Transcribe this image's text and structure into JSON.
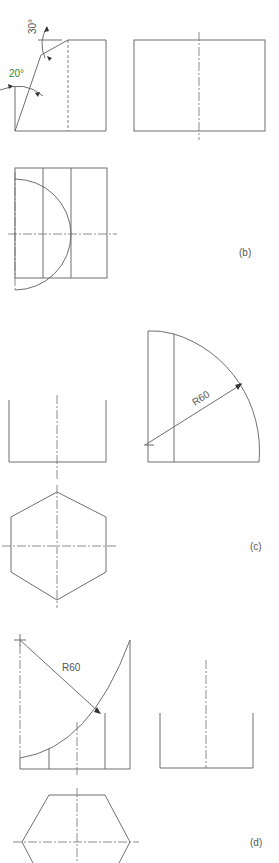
{
  "figure": {
    "panels": [
      {
        "id": "a",
        "annotations": [
          {
            "text": "30°",
            "color": "#555555"
          },
          {
            "text": "20°",
            "color": "#2e8b2e"
          }
        ]
      },
      {
        "id": "b",
        "label": "(b)"
      },
      {
        "id": "c",
        "label": "(c)",
        "annotations": [
          {
            "text": "R60"
          }
        ]
      },
      {
        "id": "d",
        "label": "(d)",
        "annotations": [
          {
            "text": "R60"
          }
        ]
      }
    ]
  },
  "colors": {
    "line": "#6f6f6f",
    "angle_accent": "#2e8b2e",
    "background": "#ffffff"
  }
}
